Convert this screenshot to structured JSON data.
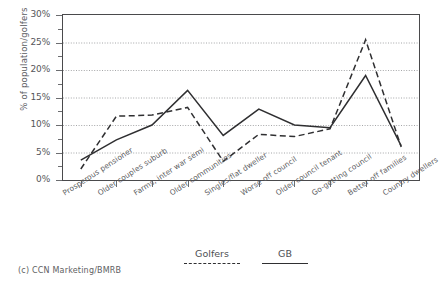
{
  "chart_data": {
    "type": "line",
    "title": "",
    "xlabel": "",
    "ylabel": "% of population/golfers",
    "ylim": [
      0,
      30
    ],
    "ytick_labels": [
      "0%",
      "5%",
      "10%",
      "15%",
      "20%",
      "25%",
      "30%"
    ],
    "ytick_values": [
      0,
      5,
      10,
      15,
      20,
      25,
      30
    ],
    "grid": true,
    "legend_position": "bottom",
    "categories": [
      "Prosperous pensioner",
      "Older couples suburb",
      "Farms, inter war semi",
      "Older communities",
      "Singles/flat dweller",
      "Worse off council",
      "Older council tenant",
      "Go-getting council",
      "Better off families",
      "Country dwellers"
    ],
    "series": [
      {
        "name": "Golfers",
        "style": "dashed",
        "color": "#2f2f31",
        "values": [
          2.0,
          11.6,
          11.8,
          13.2,
          3.4,
          8.3,
          7.9,
          9.3,
          25.5,
          6.0
        ]
      },
      {
        "name": "GB",
        "style": "solid",
        "color": "#2f2f31",
        "values": [
          3.6,
          7.3,
          10.0,
          16.3,
          8.1,
          12.9,
          10.0,
          9.5,
          19.0,
          6.2
        ]
      }
    ]
  },
  "footer": {
    "credit": "(c) CCN Marketing/BMRB"
  }
}
